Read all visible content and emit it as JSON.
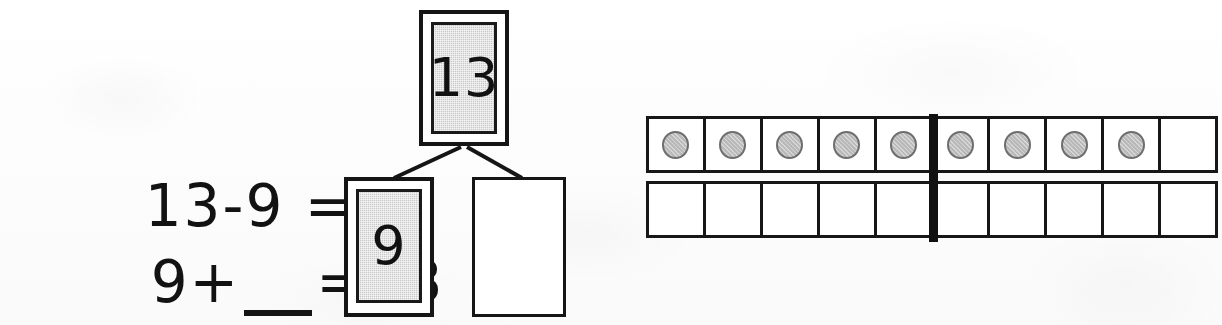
{
  "worksheet": {
    "background_color": "#fdfdfd",
    "ink_color": "#121212",
    "shaded_fill_color": "#c9c9c9",
    "counter_fill_color": "#b9b9b9"
  },
  "equations": {
    "line_one": {
      "minuend": "13",
      "minus_sign": "-",
      "subtrahend": "9",
      "equals_sign": "=",
      "answer": "",
      "full_text": "13 - 9 ="
    },
    "line_two": {
      "addend_known": "9",
      "plus_sign": "+",
      "blank": "",
      "equals_sign": "=",
      "sum": "13",
      "full_text": "9 + ___ = 13"
    }
  },
  "number_bond": {
    "whole": {
      "label": "13",
      "shaded": true,
      "filled_in": true
    },
    "part_one": {
      "label": "9",
      "shaded": true,
      "filled_in": true
    },
    "part_two": {
      "label": "",
      "shaded": false,
      "filled_in": false
    },
    "connector_count": 2
  },
  "chart_data": {
    "type": "table",
    "rows": 2,
    "columns": 10,
    "midline_after_column": 5,
    "categories": [
      "top-1",
      "top-2",
      "top-3",
      "top-4",
      "top-5",
      "top-6",
      "top-7",
      "top-8",
      "top-9",
      "top-10",
      "bottom-1",
      "bottom-2",
      "bottom-3",
      "bottom-4",
      "bottom-5",
      "bottom-6",
      "bottom-7",
      "bottom-8",
      "bottom-9",
      "bottom-10"
    ],
    "values": [
      1,
      1,
      1,
      1,
      1,
      1,
      1,
      1,
      1,
      0,
      0,
      0,
      0,
      0,
      0,
      0,
      0,
      0,
      0,
      0
    ],
    "total_counters": 9,
    "grid": true,
    "legend": []
  },
  "ten_frame": {
    "top_row": [
      {
        "cell": 1,
        "has_counter": true
      },
      {
        "cell": 2,
        "has_counter": true
      },
      {
        "cell": 3,
        "has_counter": true
      },
      {
        "cell": 4,
        "has_counter": true
      },
      {
        "cell": 5,
        "has_counter": true
      },
      {
        "cell": 6,
        "has_counter": true
      },
      {
        "cell": 7,
        "has_counter": true
      },
      {
        "cell": 8,
        "has_counter": true
      },
      {
        "cell": 9,
        "has_counter": true
      },
      {
        "cell": 10,
        "has_counter": false
      }
    ],
    "bottom_row": [
      {
        "cell": 1,
        "has_counter": false
      },
      {
        "cell": 2,
        "has_counter": false
      },
      {
        "cell": 3,
        "has_counter": false
      },
      {
        "cell": 4,
        "has_counter": false
      },
      {
        "cell": 5,
        "has_counter": false
      },
      {
        "cell": 6,
        "has_counter": false
      },
      {
        "cell": 7,
        "has_counter": false
      },
      {
        "cell": 8,
        "has_counter": false
      },
      {
        "cell": 9,
        "has_counter": false
      },
      {
        "cell": 10,
        "has_counter": false
      }
    ]
  }
}
